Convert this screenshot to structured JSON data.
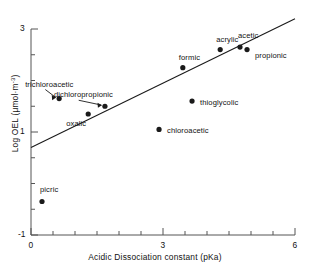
{
  "chart_data": {
    "type": "scatter",
    "title": "",
    "xlabel": "Acidic Dissociation constant (pKa)",
    "ylabel_prefix": "Log OEL (",
    "ylabel_unit": "μmol·m",
    "ylabel_exp": "-3",
    "ylabel_suffix": ")",
    "xlim": [
      0,
      6
    ],
    "ylim": [
      -1,
      3
    ],
    "xticks": [
      0,
      3,
      6
    ],
    "xtick_labels": [
      "0",
      "3",
      "6"
    ],
    "yticks": [
      -1,
      1,
      3
    ],
    "ytick_labels": [
      "-1",
      "1",
      "3"
    ],
    "minor_xtick_step": 0.5,
    "minor_ytick_step": 0.5,
    "grid": false,
    "legend": "none",
    "points": [
      {
        "name": "picric",
        "x": 0.25,
        "y": -0.35,
        "label_dx": -2,
        "label_dy": -12,
        "arrow": false
      },
      {
        "name": "trichloroacetic",
        "x": 0.64,
        "y": 1.65,
        "label_dx": -32,
        "label_dy": -14,
        "arrow": true
      },
      {
        "name": "oxalic",
        "x": 1.3,
        "y": 1.35,
        "label_dx": -22,
        "label_dy": 10,
        "arrow": false
      },
      {
        "name": "dichloropropionic",
        "x": 1.68,
        "y": 1.5,
        "label_dx": -38,
        "label_dy": -11,
        "arrow": true
      },
      {
        "name": "chloroacetic",
        "x": 2.91,
        "y": 1.05,
        "label_dx": 8,
        "label_dy": 2,
        "arrow": false
      },
      {
        "name": "formic",
        "x": 3.45,
        "y": 2.25,
        "label_dx": -4,
        "label_dy": -10,
        "arrow": false
      },
      {
        "name": "thioglycolic",
        "x": 3.66,
        "y": 1.6,
        "label_dx": 8,
        "label_dy": 2,
        "arrow": false
      },
      {
        "name": "acrylic",
        "x": 4.3,
        "y": 2.6,
        "label_dx": -4,
        "label_dy": -10,
        "arrow": false
      },
      {
        "name": "acetic",
        "x": 4.75,
        "y": 2.65,
        "label_dx": -2,
        "label_dy": -11,
        "arrow": false
      },
      {
        "name": "propionic",
        "x": 4.91,
        "y": 2.6,
        "label_dx": 8,
        "label_dy": 6,
        "arrow": false
      }
    ],
    "trendline": {
      "x0": 0.0,
      "y0": 0.7,
      "x1": 6.0,
      "y1": 3.2
    },
    "marker_color": "#1a1a1a",
    "line_color": "#1a1a1a",
    "axis_color": "#555555"
  }
}
